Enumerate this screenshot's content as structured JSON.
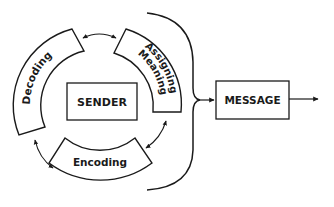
{
  "diagram": {
    "center": {
      "label": "SENDER"
    },
    "segments": [
      {
        "id": "decoding",
        "label": "Decoding"
      },
      {
        "id": "assigning-meaning",
        "label_line1": "Assigning",
        "label_line2": "Meaning"
      },
      {
        "id": "encoding",
        "label": "Encoding"
      }
    ],
    "output": {
      "label": "MESSAGE"
    },
    "colors": {
      "stroke": "#1a1a1a",
      "background": "#ffffff"
    }
  }
}
